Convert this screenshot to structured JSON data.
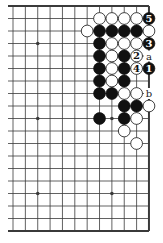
{
  "diagram": {
    "type": "go-board-problem",
    "grid": {
      "cols": 12,
      "rows": 19,
      "x0": 13,
      "y0": 6,
      "dx": 12.36,
      "dy": 12.5,
      "edges": {
        "top": true,
        "right": true,
        "bottom": true,
        "left": false
      }
    },
    "colors": {
      "line": "#3a3a3a",
      "black": "#111111",
      "white": "#ffffff",
      "label": "#222222"
    },
    "hoshi": [
      [
        2,
        3
      ],
      [
        2,
        9
      ],
      [
        8,
        9
      ],
      [
        2,
        15
      ],
      [
        8,
        15
      ]
    ],
    "stones": [
      {
        "c": 7,
        "r": 1,
        "color": "white"
      },
      {
        "c": 8,
        "r": 1,
        "color": "white"
      },
      {
        "c": 9,
        "r": 1,
        "color": "white"
      },
      {
        "c": 10,
        "r": 1,
        "color": "white"
      },
      {
        "c": 11,
        "r": 1,
        "color": "black",
        "label": "5"
      },
      {
        "c": 6,
        "r": 2,
        "color": "white"
      },
      {
        "c": 7,
        "r": 2,
        "color": "black"
      },
      {
        "c": 8,
        "r": 2,
        "color": "black"
      },
      {
        "c": 9,
        "r": 2,
        "color": "black"
      },
      {
        "c": 10,
        "r": 2,
        "color": "black"
      },
      {
        "c": 11,
        "r": 2,
        "color": "white"
      },
      {
        "c": 7,
        "r": 3,
        "color": "black"
      },
      {
        "c": 8,
        "r": 3,
        "color": "white"
      },
      {
        "c": 9,
        "r": 3,
        "color": "white"
      },
      {
        "c": 10,
        "r": 3,
        "color": "white"
      },
      {
        "c": 11,
        "r": 3,
        "color": "black",
        "label": "3"
      },
      {
        "c": 7,
        "r": 4,
        "color": "black"
      },
      {
        "c": 8,
        "r": 4,
        "color": "white"
      },
      {
        "c": 9,
        "r": 4,
        "color": "black"
      },
      {
        "c": 10,
        "r": 4,
        "color": "white",
        "label": "2"
      },
      {
        "c": 7,
        "r": 5,
        "color": "black"
      },
      {
        "c": 8,
        "r": 5,
        "color": "white"
      },
      {
        "c": 9,
        "r": 5,
        "color": "black"
      },
      {
        "c": 10,
        "r": 5,
        "color": "white",
        "label": "4"
      },
      {
        "c": 11,
        "r": 5,
        "color": "black",
        "label": "1"
      },
      {
        "c": 7,
        "r": 6,
        "color": "black"
      },
      {
        "c": 8,
        "r": 6,
        "color": "white"
      },
      {
        "c": 9,
        "r": 6,
        "color": "black"
      },
      {
        "c": 7,
        "r": 7,
        "color": "black"
      },
      {
        "c": 8,
        "r": 7,
        "color": "black"
      },
      {
        "c": 9,
        "r": 7,
        "color": "white"
      },
      {
        "c": 10,
        "r": 7,
        "color": "white"
      },
      {
        "c": 9,
        "r": 8,
        "color": "black"
      },
      {
        "c": 10,
        "r": 8,
        "color": "black"
      },
      {
        "c": 11,
        "r": 8,
        "color": "white"
      },
      {
        "c": 7,
        "r": 9,
        "color": "black"
      },
      {
        "c": 9,
        "r": 9,
        "color": "black"
      },
      {
        "c": 10,
        "r": 9,
        "color": "white"
      },
      {
        "c": 9,
        "r": 10,
        "color": "white"
      },
      {
        "c": 10,
        "r": 11,
        "color": "white"
      }
    ],
    "point_labels": [
      {
        "c": 11,
        "r": 4,
        "text": "a"
      },
      {
        "c": 11,
        "r": 7,
        "text": "b"
      }
    ]
  }
}
